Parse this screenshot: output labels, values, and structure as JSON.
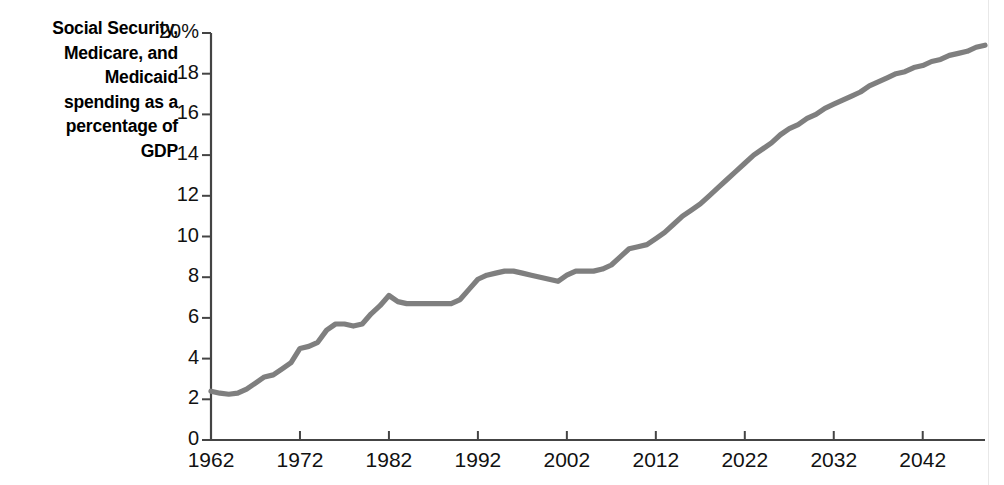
{
  "chart_data": {
    "type": "line",
    "title": "Social Security, Medicare, and Medicaid spending as a percentage of GDP",
    "title_lines": [
      "Social Security,",
      "Medicare, and",
      "Medicaid",
      "spending as a",
      "percentage of",
      "GDP"
    ],
    "xlabel": "",
    "ylabel": "Social Security, Medicare, and Medicaid spending as a percentage of GDP",
    "xlim": [
      1962,
      2049
    ],
    "ylim": [
      0,
      20
    ],
    "grid": false,
    "legend": null,
    "line_color": "#7f7f7f",
    "axis_color": "#444444",
    "y_ticks": [
      0,
      2,
      4,
      6,
      8,
      10,
      12,
      14,
      16,
      18,
      20
    ],
    "y_tick_labels": [
      "0",
      "2",
      "4",
      "6",
      "8",
      "10",
      "12",
      "14",
      "16",
      "18",
      "20%"
    ],
    "x_ticks": [
      1962,
      1972,
      1982,
      1992,
      2002,
      2012,
      2022,
      2032,
      2042
    ],
    "x_tick_labels": [
      "1962",
      "1972",
      "1982",
      "1992",
      "2002",
      "2012",
      "2022",
      "2032",
      "2042"
    ],
    "series": [
      {
        "name": "Social Security, Medicare, and Medicaid spending",
        "x": [
          1962,
          1963,
          1964,
          1965,
          1966,
          1967,
          1968,
          1969,
          1970,
          1971,
          1972,
          1973,
          1974,
          1975,
          1976,
          1977,
          1978,
          1979,
          1980,
          1981,
          1982,
          1983,
          1984,
          1985,
          1986,
          1987,
          1988,
          1989,
          1990,
          1991,
          1992,
          1993,
          1994,
          1995,
          1996,
          1997,
          1998,
          1999,
          2000,
          2001,
          2002,
          2003,
          2004,
          2005,
          2006,
          2007,
          2008,
          2009,
          2010,
          2011,
          2012,
          2013,
          2014,
          2015,
          2016,
          2017,
          2018,
          2019,
          2020,
          2021,
          2022,
          2023,
          2024,
          2025,
          2026,
          2027,
          2028,
          2029,
          2030,
          2031,
          2032,
          2033,
          2034,
          2035,
          2036,
          2037,
          2038,
          2039,
          2040,
          2041,
          2042,
          2043,
          2044,
          2045,
          2046,
          2047,
          2048,
          2049
        ],
        "values": [
          2.4,
          2.3,
          2.25,
          2.3,
          2.5,
          2.8,
          3.1,
          3.2,
          3.5,
          3.8,
          4.5,
          4.6,
          4.8,
          5.4,
          5.7,
          5.7,
          5.6,
          5.7,
          6.2,
          6.6,
          7.1,
          6.8,
          6.7,
          6.7,
          6.7,
          6.7,
          6.7,
          6.7,
          6.9,
          7.4,
          7.9,
          8.1,
          8.2,
          8.3,
          8.3,
          8.2,
          8.1,
          8.0,
          7.9,
          7.8,
          8.1,
          8.3,
          8.3,
          8.3,
          8.4,
          8.6,
          9.0,
          9.4,
          9.5,
          9.6,
          9.9,
          10.2,
          10.6,
          11.0,
          11.3,
          11.6,
          12.0,
          12.4,
          12.8,
          13.2,
          13.6,
          14.0,
          14.3,
          14.6,
          15.0,
          15.3,
          15.5,
          15.8,
          16.0,
          16.3,
          16.5,
          16.7,
          16.9,
          17.1,
          17.4,
          17.6,
          17.8,
          18.0,
          18.1,
          18.3,
          18.4,
          18.6,
          18.7,
          18.9,
          19.0,
          19.1,
          19.3,
          19.4
        ]
      }
    ]
  },
  "axes": {
    "y_axis_name": "percent-of-gdp-axis",
    "x_axis_name": "year-axis"
  }
}
